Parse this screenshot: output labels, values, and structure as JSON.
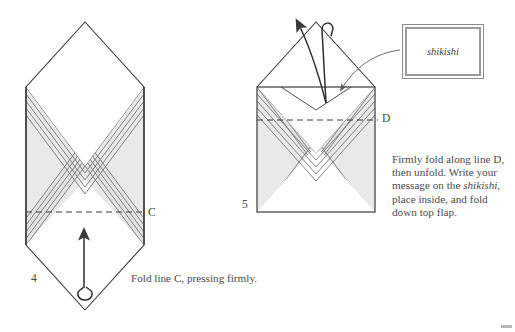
{
  "document": {
    "type": "origami-instruction-diagram",
    "background_color": "#ffffff",
    "ink_color": "#4a4a4a",
    "shade_color": "#e9e9e9",
    "band_line_color": "#6e6e6e"
  },
  "figures": [
    {
      "number": "4",
      "shape": "vertical-diamond-envelope",
      "fold_line_label": "C",
      "fold_line_style": "dashed",
      "caption": "Fold line C, pressing firmly.",
      "arrow": "upward-fold-arrow-with-loop"
    },
    {
      "number": "5",
      "shape": "rectangular-envelope-with-open-flap",
      "fold_line_label": "D",
      "fold_line_style": "dashed",
      "caption": "Firmly fold along line D, then unfold. Write your message on the shikishi, place inside, and fold down top flap.",
      "arrow": "curved-open-flap-arrow-with-loop",
      "pointer_arrow": "shikishi-insert-arrow"
    }
  ],
  "callout": {
    "label": "shikishi",
    "style": "italic",
    "border_color": "#9a9a9a"
  },
  "icons": {
    "fold_arrow": "arrow-up",
    "unfold_arrow": "arrow-curve-up-left",
    "insert_arrow": "arrow-curve-down-left"
  }
}
